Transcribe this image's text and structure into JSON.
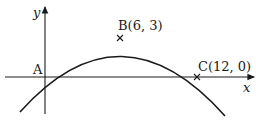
{
  "diagram": {
    "axes": {
      "x_label": "x",
      "y_label": "y"
    },
    "points": [
      {
        "name": "A",
        "label": "A",
        "coords": [
          0,
          0
        ]
      },
      {
        "name": "B",
        "label": "B(6, 3)",
        "coords": [
          6,
          3
        ]
      },
      {
        "name": "C",
        "label": "C(12, 0)",
        "coords": [
          12,
          0
        ]
      }
    ],
    "curve": {
      "type": "parabola",
      "vertex": [
        6,
        3
      ],
      "roots": [
        0,
        12
      ]
    },
    "colors": {
      "ink": "#1a1a1a",
      "background": "#ffffff"
    }
  }
}
